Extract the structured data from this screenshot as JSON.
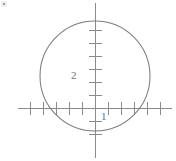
{
  "figure": {
    "width": 176,
    "height": 161,
    "background_color": "#ffffff",
    "line_color": "#8a8a8a",
    "curve_color": "#7d7d7d",
    "label_color": "#6f6f6f"
  },
  "labels": {
    "y_axis_label_2": "2",
    "x_axis_label_1": "1"
  },
  "chart_data": {
    "type": "scatter",
    "title": "",
    "xlabel": "",
    "ylabel": "",
    "grid": false,
    "legend": null,
    "axes": {
      "origin_px": {
        "x": 95,
        "y": 108
      },
      "unit_px": 13,
      "x_axis_range_px": [
        18,
        172
      ],
      "y_axis_range_px": [
        3,
        158
      ],
      "xlim": [
        -5.9,
        5.9
      ],
      "ylim": [
        -3.8,
        8.1
      ]
    },
    "x_ticks": [
      -5,
      -4,
      -3,
      -2,
      -1,
      1,
      2,
      3,
      4,
      5
    ],
    "y_ticks": [
      -2,
      -1,
      1,
      2,
      3,
      4,
      5,
      6
    ],
    "tick_labels_shown": [
      {
        "axis": "y",
        "value": 2,
        "text": "2"
      },
      {
        "axis": "x",
        "value": 1,
        "text": "1"
      }
    ],
    "series": [
      {
        "name": "circle",
        "type": "circle",
        "center": [
          0,
          2
        ],
        "radius": 4.2,
        "center_px": [
          95,
          76
        ],
        "radius_px": 55,
        "color": "#7d7d7d"
      }
    ],
    "annotations": []
  }
}
